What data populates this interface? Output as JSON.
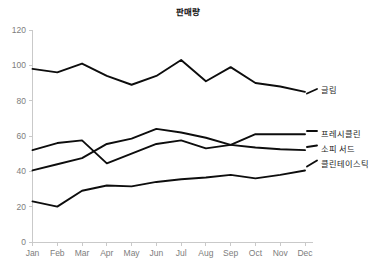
{
  "chart_data": {
    "type": "line",
    "title": "판매량",
    "xlabel": "",
    "ylabel": "",
    "categories": [
      "Jan",
      "Feb",
      "Mar",
      "Apr",
      "May",
      "Jun",
      "Jul",
      "Aug",
      "Sep",
      "Oct",
      "Nov",
      "Dec"
    ],
    "ylim": [
      0,
      120
    ],
    "yticks": [
      0,
      20,
      40,
      60,
      80,
      100,
      120
    ],
    "grid": false,
    "legend_position": "right-inline-labels",
    "line_color": "#0d0d0d",
    "axis_color": "#c9c9c9",
    "tick_label_color": "#7d7d7d",
    "series": [
      {
        "name": "글림",
        "values": [
          98,
          96,
          101,
          94,
          89,
          94,
          103,
          91,
          99,
          90,
          88,
          85
        ]
      },
      {
        "name": "프레시클린",
        "values": [
          52,
          56,
          57.5,
          44.5,
          50,
          55.5,
          57.5,
          53,
          55,
          61,
          61,
          61
        ]
      },
      {
        "name": "소피 서드",
        "values": [
          40.5,
          44,
          47.5,
          55.5,
          58.5,
          64,
          62,
          59,
          55,
          53.5,
          52.5,
          52
        ]
      },
      {
        "name": "클린테이스틱",
        "values": [
          23,
          20,
          29,
          32,
          31.5,
          34,
          35.5,
          36.5,
          38,
          36,
          38,
          40.5
        ]
      }
    ]
  }
}
